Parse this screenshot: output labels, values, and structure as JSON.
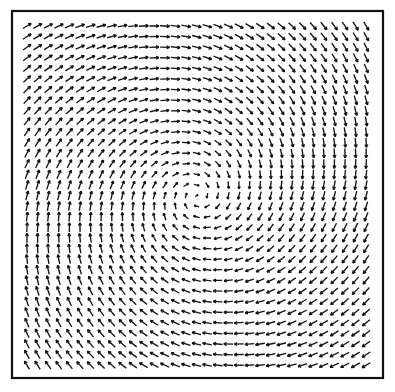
{
  "figure": {
    "kind": "vector-field-plot",
    "title": "",
    "caption": "",
    "background_color": "#ffffff",
    "ink_color": "#141414"
  },
  "frame": {
    "name": "plot-border",
    "x": 12,
    "y": 11,
    "width": 371,
    "height": 367,
    "stroke_color": "#111111",
    "stroke_width": 2.2
  },
  "chart_data": {
    "type": "scatter",
    "subtype": "quiver-vector-field",
    "title": "",
    "subtitle": "",
    "xlabel": "",
    "ylabel": "",
    "grid": false,
    "legend": null,
    "axis_ticks_visible": false,
    "axis_labels_visible": false,
    "xlim": [
      -1,
      1
    ],
    "ylim": [
      -1,
      1
    ],
    "field": {
      "description": "Clockwise spiral vortex vector field sampled on a uniform square grid",
      "pattern": "vortex",
      "rotation": "clockwise",
      "inward_spiral": true,
      "spiral_pitch_deg": 14,
      "center_x_px": 197,
      "center_y_px": 196,
      "grid_columns": 33,
      "grid_rows": 33,
      "grid_spacing_px": 10.6,
      "plot_x0_px": 27,
      "plot_y0_px": 26,
      "arrow_max_length_px": 10.4,
      "arrow_min_length_px": 3.2,
      "arrow_head_length_px": 3.4,
      "arrow_head_angle_deg": 27,
      "magnitude_model": "saturating: r/(r+r0), r0 = 0.16",
      "stroke_width_px": 1.35
    },
    "sample_vectors": [
      {
        "x_px": 32,
        "y_px": 31,
        "angle_deg": -45,
        "magnitude": 0.93
      },
      {
        "x_px": 197,
        "y_px": 31,
        "angle_deg": 0,
        "magnitude": 0.92
      },
      {
        "x_px": 362,
        "y_px": 31,
        "angle_deg": 45,
        "magnitude": 0.93
      },
      {
        "x_px": 32,
        "y_px": 196,
        "angle_deg": -90,
        "magnitude": 0.91
      },
      {
        "x_px": 362,
        "y_px": 196,
        "angle_deg": 90,
        "magnitude": 0.91
      },
      {
        "x_px": 32,
        "y_px": 362,
        "angle_deg": -135,
        "magnitude": 0.93
      },
      {
        "x_px": 197,
        "y_px": 362,
        "angle_deg": 180,
        "magnitude": 0.92
      },
      {
        "x_px": 362,
        "y_px": 362,
        "angle_deg": 135,
        "magnitude": 0.93
      },
      {
        "x_px": 197,
        "y_px": 175,
        "angle_deg": 0,
        "magnitude": 0.34
      },
      {
        "x_px": 197,
        "y_px": 217,
        "angle_deg": 180,
        "magnitude": 0.34
      }
    ]
  }
}
